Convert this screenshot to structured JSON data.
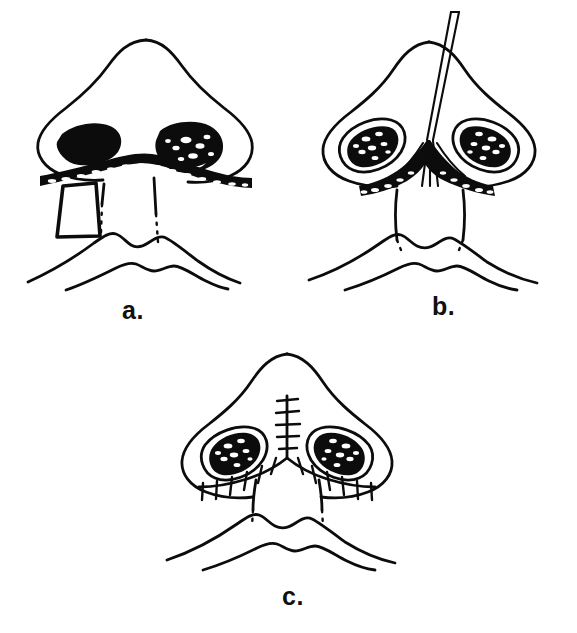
{
  "figure": {
    "view": "basal/worm's-eye view of nose, upper lip and chin",
    "style": "black-ink line drawing on white background",
    "background_color": "#ffffff",
    "ink_color": "#0c0c0c",
    "panel_count": 3
  },
  "panels": [
    {
      "id": "a",
      "label": "a.",
      "caption_text": "a.",
      "position": "top-left",
      "description": "Basal view of nose showing incision outline across the nostril sills and columella base with a rectangular surgical retractor/flap elevated on the left side. The left nostril contains a chevron-shaped arrow marking; nostril rims are stippled black. Columella borders shown partly solid, partly dotted.",
      "features": [
        {
          "name": "nose-outline",
          "kind": "contour"
        },
        {
          "name": "left-nostril",
          "kind": "stippled-aperture"
        },
        {
          "name": "right-nostril",
          "kind": "stippled-aperture"
        },
        {
          "name": "incision-band",
          "kind": "stippled-band"
        },
        {
          "name": "retractor-flap",
          "kind": "rectangle-instrument"
        },
        {
          "name": "columella-dotted-outline",
          "kind": "dotted-line"
        },
        {
          "name": "upper-lip",
          "kind": "contour"
        },
        {
          "name": "lower-lip",
          "kind": "contour"
        }
      ]
    },
    {
      "id": "b",
      "label": "b.",
      "caption_text": "b.",
      "position": "top-right",
      "description": "Same basal view with a long thin needle/instrument inserted vertically through the nasal tip into the midline. The nostril sills are opened, exposing a dark triangular defect between the medial crura; stippled incision bands flank it.",
      "features": [
        {
          "name": "nose-outline",
          "kind": "contour"
        },
        {
          "name": "left-nostril",
          "kind": "stippled-aperture"
        },
        {
          "name": "right-nostril",
          "kind": "stippled-aperture"
        },
        {
          "name": "needle-instrument",
          "kind": "double-line-instrument"
        },
        {
          "name": "open-defect",
          "kind": "solid-black-region"
        },
        {
          "name": "columella-outline",
          "kind": "contour"
        },
        {
          "name": "upper-lip",
          "kind": "contour"
        },
        {
          "name": "lower-lip",
          "kind": "contour"
        }
      ]
    },
    {
      "id": "c",
      "label": "c.",
      "caption_text": "c.",
      "position": "bottom-center",
      "description": "Final closed result: a vertical midline suture line runs up the columella and tip with transverse stitch marks; additional interrupted sutures run laterally along both nostril sills. Nostrils are narrower and more oval than in panels a and b.",
      "features": [
        {
          "name": "nose-outline",
          "kind": "contour"
        },
        {
          "name": "left-nostril",
          "kind": "stippled-aperture"
        },
        {
          "name": "right-nostril",
          "kind": "stippled-aperture"
        },
        {
          "name": "vertical-suture-line",
          "kind": "suture-line"
        },
        {
          "name": "left-sill-suture-line",
          "kind": "suture-line"
        },
        {
          "name": "right-sill-suture-line",
          "kind": "suture-line"
        },
        {
          "name": "columella-dotted-outline",
          "kind": "dotted-line"
        },
        {
          "name": "upper-lip",
          "kind": "contour"
        },
        {
          "name": "lower-lip",
          "kind": "contour"
        }
      ],
      "suture_counts": {
        "vertical_midline_stitches": 5,
        "left_sill_stitches": 6,
        "right_sill_stitches": 6
      }
    }
  ]
}
